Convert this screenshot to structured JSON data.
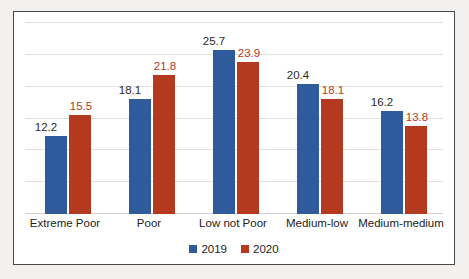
{
  "chart_data": {
    "type": "bar",
    "title": "",
    "xlabel": "",
    "ylabel": "",
    "categories": [
      "Extreme Poor",
      "Poor",
      "Low not Poor",
      "Medium-low",
      "Medium-medium"
    ],
    "series": [
      {
        "name": "2019",
        "color": "#2f5b9c",
        "values": [
          12.2,
          18.1,
          25.7,
          20.4,
          16.2
        ]
      },
      {
        "name": "2020",
        "color": "#b5391f",
        "values": [
          15.5,
          21.8,
          23.9,
          18.1,
          13.8
        ]
      }
    ],
    "ylim": [
      0,
      30
    ],
    "gridlines": [
      5,
      10,
      15,
      20,
      25,
      30
    ],
    "grid": true,
    "axis_labels_visible": false,
    "data_labels": [
      [
        "12.2",
        "15.5"
      ],
      [
        "18.1",
        "21.8"
      ],
      [
        "25.7",
        "23.9"
      ],
      [
        "20.4",
        "18.1"
      ],
      [
        "16.2",
        "13.8"
      ]
    ],
    "legend": {
      "position": "bottom",
      "entries": [
        {
          "label": "2019",
          "color": "#2f5b9c"
        },
        {
          "label": "2020",
          "color": "#b5391f"
        }
      ]
    }
  }
}
